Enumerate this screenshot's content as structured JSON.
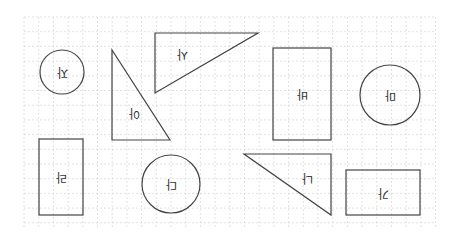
{
  "diagram": {
    "grid": {
      "x0": 24,
      "y0": 17,
      "x1": 436,
      "y1": 227,
      "step": 14.7,
      "line_color": "#d9d9d9"
    },
    "stroke_color": "#444444",
    "label_rotation_deg": 180,
    "shapes": [
      {
        "id": "circle-top-left",
        "type": "circle",
        "cx": 62,
        "cy": 72,
        "r": 22,
        "label": "자"
      },
      {
        "id": "triangle-top",
        "type": "triangle",
        "points": "155,33 258,33 155,93",
        "label": "사",
        "lx": 182,
        "ly": 54
      },
      {
        "id": "triangle-left",
        "type": "triangle",
        "points": "112,50 112,140 170,140",
        "label": "아",
        "lx": 134,
        "ly": 113
      },
      {
        "id": "rect-middle",
        "type": "rect",
        "x": 273,
        "y": 48,
        "w": 58,
        "h": 92,
        "label": "바"
      },
      {
        "id": "circle-right",
        "type": "circle",
        "cx": 390,
        "cy": 95,
        "r": 30,
        "label": "마"
      },
      {
        "id": "rect-bottom-left",
        "type": "rect",
        "x": 39,
        "y": 139,
        "w": 44,
        "h": 76,
        "label": "라"
      },
      {
        "id": "circle-bottom",
        "type": "circle",
        "cx": 171,
        "cy": 184,
        "r": 29,
        "label": "다"
      },
      {
        "id": "triangle-bottom",
        "type": "triangle",
        "points": "244,154 331,154 331,215",
        "label": "나",
        "lx": 307,
        "ly": 178
      },
      {
        "id": "rect-bottom-right",
        "type": "rect",
        "x": 346,
        "y": 170,
        "w": 74,
        "h": 45,
        "label": "가"
      }
    ]
  }
}
